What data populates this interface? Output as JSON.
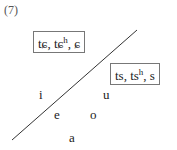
{
  "figure_label": "(7)",
  "boxes": {
    "alveolo_palatal": {
      "parts": [
        "tɕ, tɕ",
        "h",
        ", ɕ"
      ]
    },
    "dental": {
      "parts": [
        "ts, ts",
        "h",
        ", s"
      ]
    }
  },
  "vowels": {
    "i": "i",
    "u": "u",
    "e": "e",
    "o": "o",
    "a": "a"
  },
  "divider_line": {
    "x1": 137,
    "y1": 30,
    "x2": 12,
    "y2": 140,
    "color": "#333333"
  }
}
